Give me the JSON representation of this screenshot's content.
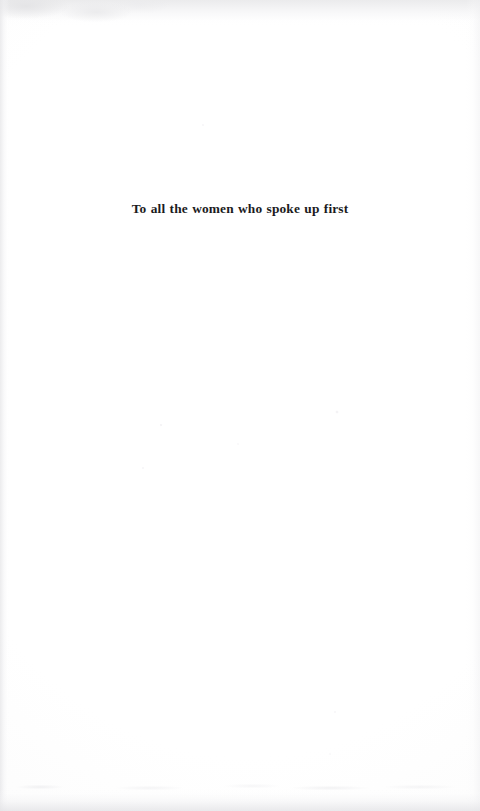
{
  "page": {
    "kind": "book-dedication-page",
    "width": 480,
    "height": 811,
    "background_color": "#fdfdfd",
    "text_color": "#1b1b1d"
  },
  "dedication": {
    "text": "To all the women who spoke up first"
  }
}
